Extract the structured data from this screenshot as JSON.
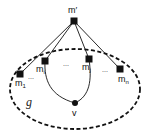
{
  "diagram": {
    "top_node": {
      "label": "m′",
      "x": 74,
      "y": 21
    },
    "boundary_nodes": [
      {
        "id": "m1",
        "base": "m",
        "sub": "1",
        "x": 20,
        "y": 74,
        "lx": 15,
        "ly": 85
      },
      {
        "id": "mi",
        "base": "m",
        "sub": "i",
        "x": 45,
        "y": 61,
        "lx": 36,
        "ly": 72
      },
      {
        "id": "mj",
        "base": "m",
        "sub": "j",
        "x": 89,
        "y": 59,
        "lx": 82,
        "ly": 70
      },
      {
        "id": "mn",
        "base": "m",
        "sub": "n",
        "x": 120,
        "y": 69,
        "lx": 118,
        "ly": 82
      }
    ],
    "ellipsis": [
      "...",
      "...",
      "..."
    ],
    "inner_node": {
      "label": "v",
      "x": 75,
      "y": 103
    },
    "region_label": "g"
  }
}
